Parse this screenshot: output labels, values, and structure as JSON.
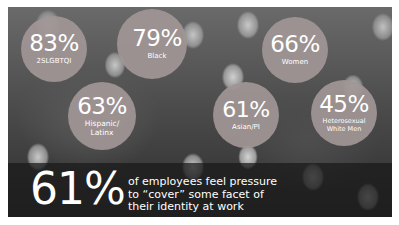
{
  "infographic": {
    "stats": [
      {
        "id": "2slgbtqi",
        "percent": "83%",
        "label": "2SLGBTQI"
      },
      {
        "id": "black",
        "percent": "79%",
        "label": "Black"
      },
      {
        "id": "women",
        "percent": "66%",
        "label": "Women"
      },
      {
        "id": "hispanic-latinx",
        "percent": "63%",
        "label_line1": "Hispanic/",
        "label_line2": "Latinx"
      },
      {
        "id": "asian-pi",
        "percent": "61%",
        "label": "Asian/PI"
      },
      {
        "id": "heterosexual-white-men",
        "percent": "45%",
        "label_line1": "Heterosexual",
        "label_line2": "White Men"
      }
    ],
    "headline": {
      "percent": "61%",
      "caption_line1": "of employees feel pressure",
      "caption_line2": "to “cover” some facet of",
      "caption_line3": "their identity at work"
    },
    "colors": {
      "circle": "#a09696",
      "banner": "#191919",
      "text": "#ffffff"
    },
    "background_image": "grayscale photo of a crowd of people wearing white masks"
  }
}
